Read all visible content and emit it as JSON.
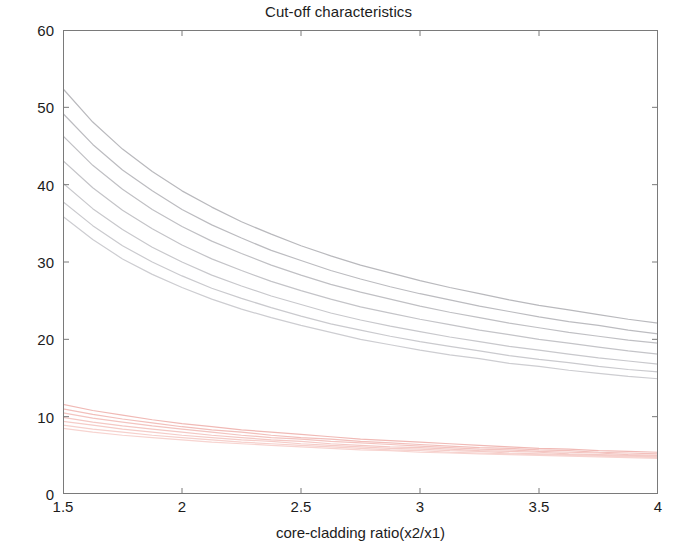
{
  "chart_data": {
    "type": "line",
    "title": "Cut-off characteristics",
    "xlabel": "core-cladding ratio(x2/x1)",
    "ylabel": "Cut-off (Vc) value",
    "xlim": [
      1.5,
      4
    ],
    "ylim": [
      0,
      60
    ],
    "xticks": [
      "1.5",
      "2",
      "2.5",
      "3",
      "3.5",
      "4"
    ],
    "xtick_values": [
      1.5,
      2,
      2.5,
      3,
      3.5,
      4
    ],
    "yticks": [
      "0",
      "10",
      "20",
      "30",
      "40",
      "50",
      "60"
    ],
    "ytick_values": [
      0,
      10,
      20,
      30,
      40,
      50,
      60
    ],
    "grid": false,
    "legend": "none",
    "box": true,
    "x": [
      1.5,
      1.625,
      1.75,
      1.875,
      2.0,
      2.125,
      2.25,
      2.375,
      2.5,
      2.625,
      2.75,
      2.875,
      3.0,
      3.125,
      3.25,
      3.375,
      3.5,
      3.625,
      3.75,
      3.875,
      4.0
    ],
    "series": [
      {
        "name": "upper-mode-1",
        "color": "#b9b9bd",
        "values": [
          52.4,
          48.1,
          44.6,
          41.7,
          39.2,
          37.1,
          35.2,
          33.6,
          32.1,
          30.8,
          29.6,
          28.6,
          27.6,
          26.7,
          25.9,
          25.1,
          24.4,
          23.8,
          23.2,
          22.6,
          22.1
        ]
      },
      {
        "name": "upper-mode-2",
        "color": "#bcbcc0",
        "values": [
          49.2,
          45.2,
          41.9,
          39.2,
          36.8,
          34.8,
          33.1,
          31.5,
          30.2,
          28.9,
          27.8,
          26.8,
          25.9,
          25.1,
          24.3,
          23.6,
          22.9,
          22.3,
          21.8,
          21.2,
          20.7
        ]
      },
      {
        "name": "upper-mode-3",
        "color": "#c0c0c4",
        "values": [
          46.3,
          42.5,
          39.4,
          36.8,
          34.6,
          32.7,
          31.1,
          29.6,
          28.3,
          27.1,
          26.1,
          25.2,
          24.3,
          23.5,
          22.8,
          22.1,
          21.5,
          20.9,
          20.4,
          19.9,
          19.5
        ]
      },
      {
        "name": "upper-mode-4",
        "color": "#c4c4c8",
        "values": [
          43.1,
          39.6,
          36.7,
          34.3,
          32.2,
          30.4,
          28.9,
          27.5,
          26.3,
          25.2,
          24.2,
          23.4,
          22.6,
          21.9,
          21.2,
          20.6,
          20.0,
          19.5,
          19.0,
          18.5,
          18.1
        ]
      },
      {
        "name": "upper-mode-5",
        "color": "#c8c8cc",
        "values": [
          40.2,
          36.9,
          34.2,
          31.9,
          30.0,
          28.3,
          26.9,
          25.6,
          24.5,
          23.4,
          22.5,
          21.7,
          21.0,
          20.3,
          19.7,
          19.1,
          18.6,
          18.1,
          17.6,
          17.2,
          16.8
        ]
      },
      {
        "name": "upper-mode-6",
        "color": "#cacace",
        "values": [
          37.8,
          34.7,
          32.1,
          30.0,
          28.2,
          26.6,
          25.3,
          24.1,
          23.0,
          22.0,
          21.2,
          20.4,
          19.7,
          19.1,
          18.5,
          17.9,
          17.4,
          17.0,
          16.5,
          16.1,
          15.8
        ]
      },
      {
        "name": "upper-mode-7",
        "color": "#cdcdd1",
        "values": [
          35.9,
          32.9,
          30.4,
          28.4,
          26.7,
          25.2,
          23.9,
          22.8,
          21.8,
          20.9,
          20.0,
          19.3,
          18.6,
          18.0,
          17.5,
          16.9,
          16.5,
          16.0,
          15.6,
          15.2,
          14.9
        ]
      },
      {
        "name": "lower-mode-1",
        "color": "#f0b9b5",
        "values": [
          11.6,
          10.8,
          10.2,
          9.6,
          9.1,
          8.7,
          8.3,
          8.0,
          7.7,
          7.4,
          7.1,
          6.9,
          6.7,
          6.5,
          6.3,
          6.1,
          5.9,
          5.8,
          5.6,
          5.5,
          5.4
        ]
      },
      {
        "name": "lower-mode-2",
        "color": "#f2bfbb",
        "values": [
          11.0,
          10.3,
          9.7,
          9.2,
          8.7,
          8.3,
          8.0,
          7.6,
          7.3,
          7.1,
          6.8,
          6.6,
          6.4,
          6.2,
          6.0,
          5.9,
          5.7,
          5.6,
          5.4,
          5.3,
          5.2
        ]
      },
      {
        "name": "lower-mode-3",
        "color": "#f3c4c0",
        "values": [
          10.5,
          9.8,
          9.3,
          8.8,
          8.4,
          8.0,
          7.6,
          7.3,
          7.1,
          6.8,
          6.6,
          6.4,
          6.2,
          6.0,
          5.8,
          5.7,
          5.5,
          5.4,
          5.3,
          5.1,
          5.0
        ]
      },
      {
        "name": "lower-mode-4",
        "color": "#f4c8c4",
        "values": [
          9.9,
          9.3,
          8.8,
          8.4,
          8.0,
          7.6,
          7.3,
          7.0,
          6.8,
          6.5,
          6.3,
          6.1,
          6.0,
          5.8,
          5.6,
          5.5,
          5.4,
          5.2,
          5.1,
          5.0,
          4.9
        ]
      },
      {
        "name": "lower-mode-5",
        "color": "#f5ccc8",
        "values": [
          9.4,
          8.9,
          8.4,
          8.0,
          7.6,
          7.3,
          7.0,
          6.8,
          6.5,
          6.3,
          6.1,
          5.9,
          5.8,
          5.6,
          5.5,
          5.3,
          5.2,
          5.1,
          5.0,
          4.9,
          4.8
        ]
      },
      {
        "name": "lower-mode-6",
        "color": "#f6d0cc",
        "values": [
          8.9,
          8.4,
          8.0,
          7.6,
          7.3,
          7.0,
          6.7,
          6.5,
          6.3,
          6.1,
          5.9,
          5.7,
          5.6,
          5.4,
          5.3,
          5.2,
          5.1,
          5.0,
          4.9,
          4.8,
          4.7
        ]
      },
      {
        "name": "lower-mode-7",
        "color": "#f7d4d0",
        "values": [
          8.5,
          8.0,
          7.6,
          7.3,
          7.0,
          6.7,
          6.5,
          6.3,
          6.1,
          5.9,
          5.7,
          5.6,
          5.4,
          5.3,
          5.2,
          5.1,
          5.0,
          4.9,
          4.8,
          4.7,
          4.6
        ]
      }
    ]
  },
  "axis_color": "#7a7a7a",
  "text_color": "#1c1c1c",
  "background": "#ffffff"
}
